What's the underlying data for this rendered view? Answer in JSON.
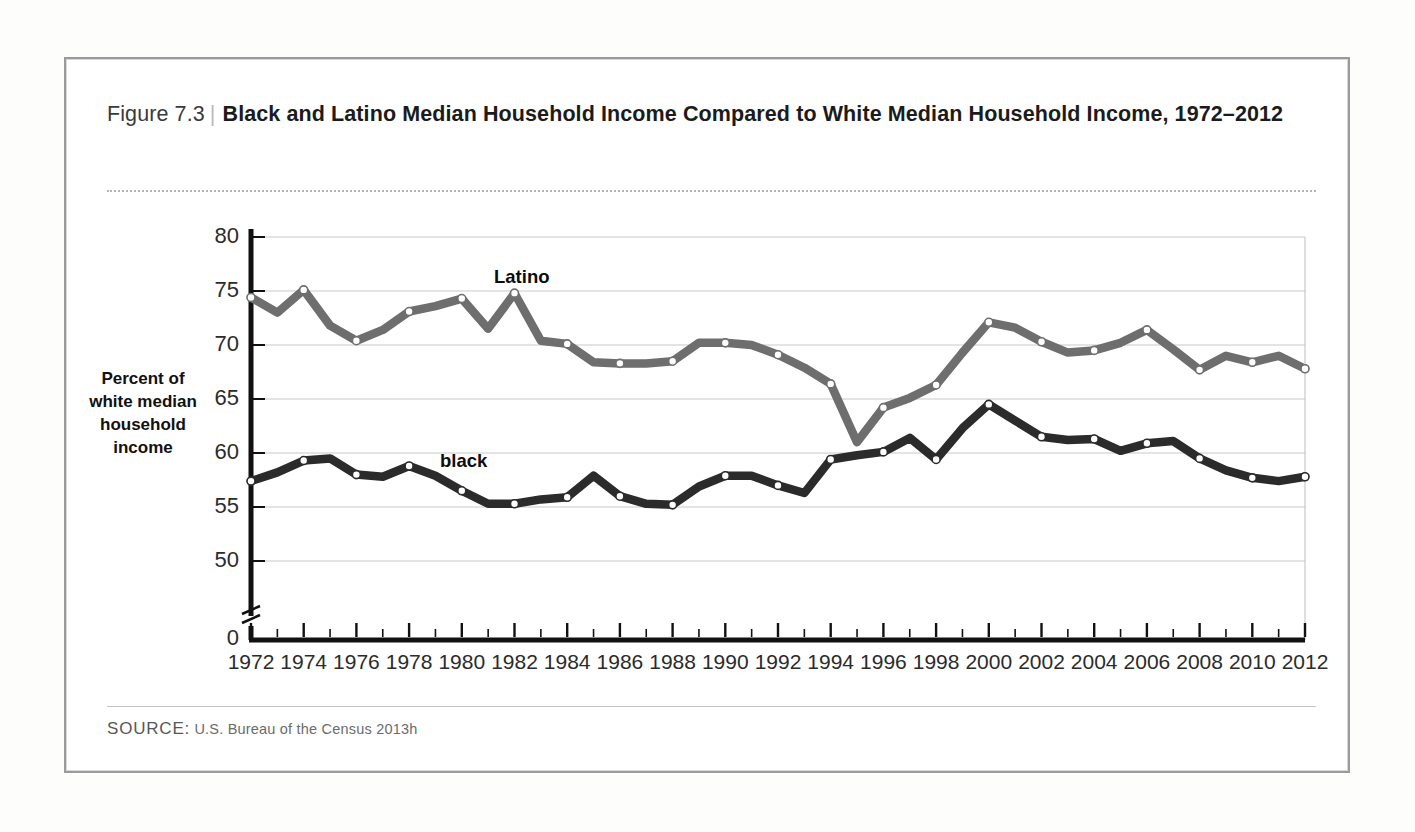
{
  "figure": {
    "number_label": "Figure 7.3",
    "separator": "|",
    "title": "Black and Latino Median Household Income Compared to White Median Household Income, 1972–2012",
    "source_label": "SOURCE:",
    "source_text": "U.S. Bureau of the Census 2013h"
  },
  "colors": {
    "latino_line": "#6e6e6e",
    "black_line": "#2b2b2b",
    "axis": "#111111",
    "gridline": "#c9c9c9",
    "frame": "#9a9a9a",
    "marker_fill": "#ffffff"
  },
  "chart_data": {
    "type": "line",
    "title": "Black and Latino Median Household Income Compared to White Median Household Income, 1972–2012",
    "xlabel": "",
    "ylabel": "Percent of white median household income",
    "ylim": [
      48,
      80
    ],
    "y_axis_break": true,
    "y_break_value": "0",
    "yticks": [
      80,
      75,
      70,
      65,
      60,
      55,
      50
    ],
    "ytick_labels": [
      "80",
      "75",
      "70",
      "65",
      "60",
      "55",
      "50"
    ],
    "zero_label": "0",
    "xlim": [
      1972,
      2012
    ],
    "xticks": [
      1972,
      1974,
      1976,
      1978,
      1980,
      1982,
      1984,
      1986,
      1988,
      1990,
      1992,
      1994,
      1996,
      1998,
      2000,
      2002,
      2004,
      2006,
      2008,
      2010,
      2012
    ],
    "xtick_labels": [
      "1972",
      "1974",
      "1976",
      "1978",
      "1980",
      "1982",
      "1984",
      "1986",
      "1988",
      "1990",
      "1992",
      "1994",
      "1996",
      "1998",
      "2000",
      "2002",
      "2004",
      "2006",
      "2008",
      "2010",
      "2012"
    ],
    "minor_xticks": [
      1973,
      1975,
      1977,
      1979,
      1981,
      1983,
      1985,
      1987,
      1989,
      1991,
      1993,
      1995,
      1997,
      1999,
      2001,
      2003,
      2005,
      2007,
      2009,
      2011
    ],
    "grid": true,
    "legend": "inline-labels",
    "x": [
      1972,
      1973,
      1974,
      1975,
      1976,
      1977,
      1978,
      1979,
      1980,
      1981,
      1982,
      1983,
      1984,
      1985,
      1986,
      1987,
      1988,
      1989,
      1990,
      1991,
      1992,
      1993,
      1994,
      1995,
      1996,
      1997,
      1998,
      1999,
      2000,
      2001,
      2002,
      2003,
      2004,
      2005,
      2006,
      2007,
      2008,
      2009,
      2010,
      2011,
      2012
    ],
    "series": [
      {
        "name": "Latino",
        "label": "Latino",
        "color": "#6e6e6e",
        "values": [
          74.4,
          73.0,
          75.1,
          71.8,
          70.4,
          71.4,
          73.1,
          73.6,
          74.3,
          71.5,
          74.8,
          70.4,
          70.1,
          68.4,
          68.3,
          68.3,
          68.5,
          70.2,
          70.2,
          70.0,
          69.1,
          67.9,
          66.4,
          61.0,
          64.2,
          65.1,
          66.3,
          69.3,
          72.1,
          71.6,
          70.3,
          69.3,
          69.5,
          70.2,
          71.4,
          69.6,
          67.7,
          69.0,
          68.4,
          69.0,
          67.8
        ]
      },
      {
        "name": "black",
        "label": "black",
        "color": "#2b2b2b",
        "values": [
          57.4,
          58.2,
          59.3,
          59.5,
          58.0,
          57.8,
          58.8,
          57.9,
          56.5,
          55.3,
          55.3,
          55.7,
          55.9,
          57.9,
          56.0,
          55.3,
          55.2,
          56.9,
          57.9,
          57.9,
          57.0,
          56.3,
          59.4,
          59.8,
          60.1,
          61.4,
          59.4,
          62.3,
          64.5,
          63.0,
          61.5,
          61.2,
          61.3,
          60.2,
          60.9,
          61.1,
          59.5,
          58.4,
          57.7,
          57.4,
          57.8
        ]
      }
    ]
  },
  "plot_geometry": {
    "x_left_px": 251,
    "x_right_px": 1305,
    "y_80_px": 237,
    "y_50_px": 561,
    "axis_bottom_px": 640
  }
}
